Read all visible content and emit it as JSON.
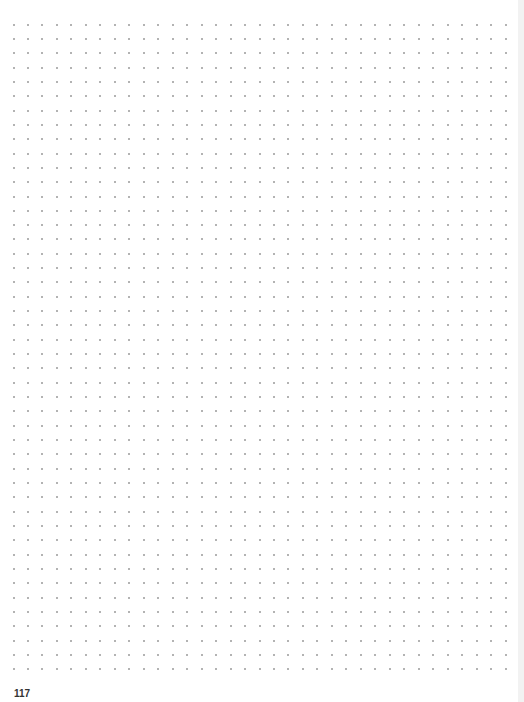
{
  "page": {
    "page_number": "117",
    "background_color": "#ffffff",
    "edge_color": "#f2f2f2"
  },
  "dot_grid": {
    "rows": 46,
    "columns": 35,
    "origin_x": 13.5,
    "origin_y": 24.5,
    "pitch_x": 14.47,
    "pitch_y": 14.33,
    "dot_color": "#9a9a9a"
  }
}
